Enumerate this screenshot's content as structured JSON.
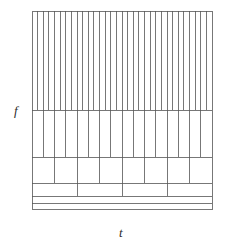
{
  "figure": {
    "kind": "time-frequency-tiling",
    "axes": {
      "y_label": "f",
      "x_label": "t"
    },
    "frame": {
      "left": 32,
      "top": 11,
      "right": 212,
      "bottom": 209,
      "stroke_color": "#555555",
      "stroke_width": 0.8
    },
    "bands": [
      {
        "name": "band-1",
        "y_top": 11,
        "y_bottom": 110,
        "divisions": 32
      },
      {
        "name": "band-2",
        "y_top": 110,
        "y_bottom": 157,
        "divisions": 16
      },
      {
        "name": "band-3",
        "y_top": 157,
        "y_bottom": 183,
        "divisions": 8
      },
      {
        "name": "band-4",
        "y_top": 183,
        "y_bottom": 196,
        "divisions": 4
      },
      {
        "name": "band-5",
        "y_top": 196,
        "y_bottom": 203,
        "divisions": 1
      },
      {
        "name": "band-6",
        "y_top": 203,
        "y_bottom": 209,
        "divisions": 1
      }
    ]
  },
  "chart_data": {
    "type": "heatmap",
    "title": "",
    "subtitle": "",
    "xlabel": "t",
    "ylabel": "f",
    "xlim": [
      0,
      1
    ],
    "ylim": [
      0,
      1
    ],
    "grid": true,
    "legend": null,
    "annotations": [],
    "tiling_rows": [
      {
        "row": 1,
        "frequency_band": "highest",
        "time_tiles": 32,
        "y_fraction_top": 1.0,
        "y_fraction_bottom": 0.5
      },
      {
        "row": 2,
        "frequency_band": "high",
        "time_tiles": 16,
        "y_fraction_top": 0.5,
        "y_fraction_bottom": 0.263
      },
      {
        "row": 3,
        "frequency_band": "mid",
        "time_tiles": 8,
        "y_fraction_top": 0.263,
        "y_fraction_bottom": 0.131
      },
      {
        "row": 4,
        "frequency_band": "low",
        "time_tiles": 4,
        "y_fraction_top": 0.131,
        "y_fraction_bottom": 0.066
      },
      {
        "row": 5,
        "frequency_band": "lower",
        "time_tiles": 1,
        "y_fraction_top": 0.066,
        "y_fraction_bottom": 0.03
      },
      {
        "row": 6,
        "frequency_band": "lowest",
        "time_tiles": 1,
        "y_fraction_top": 0.03,
        "y_fraction_bottom": 0.0
      }
    ],
    "x_tick_labels": [],
    "y_tick_labels": []
  },
  "style": {
    "background": "#ffffff",
    "line_color": "#555555",
    "text_color": "#2b2b2b"
  }
}
